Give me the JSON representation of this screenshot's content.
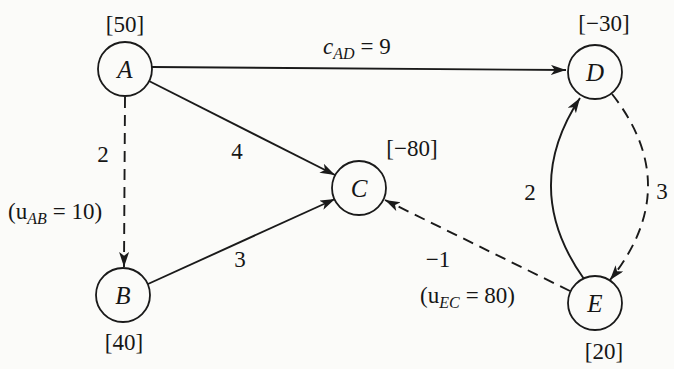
{
  "figure": {
    "colors": {
      "ink": "#1a1a1a",
      "paper": "#fbfbf9"
    }
  },
  "graph": {
    "nodes": {
      "A": {
        "label": "A",
        "supply": "[50]"
      },
      "B": {
        "label": "B",
        "supply": "[40]"
      },
      "C": {
        "label": "C",
        "supply": "[−80]"
      },
      "D": {
        "label": "D",
        "supply": "[−30]"
      },
      "E": {
        "label": "E",
        "supply": "[20]"
      }
    },
    "edges": {
      "AD": {
        "from": "A",
        "to": "D",
        "line": "solid",
        "cost_label": {
          "var": "c",
          "sub": "AD",
          "eq": "= 9"
        }
      },
      "AC": {
        "from": "A",
        "to": "C",
        "line": "solid",
        "cost": "4"
      },
      "AB": {
        "from": "A",
        "to": "B",
        "line": "dashed",
        "cost": "2",
        "capacity_label": {
          "open": "(u",
          "sub": "AB",
          "eq": "= 10)"
        }
      },
      "BC": {
        "from": "B",
        "to": "C",
        "line": "solid",
        "cost": "3"
      },
      "EC": {
        "from": "E",
        "to": "C",
        "line": "dashed",
        "cost": "−1",
        "capacity_label": {
          "open": "(u",
          "sub": "EC",
          "eq": "= 80)"
        }
      },
      "ED": {
        "from": "E",
        "to": "D",
        "line": "solid",
        "cost": "2"
      },
      "DE": {
        "from": "D",
        "to": "E",
        "line": "dashed",
        "cost": "3"
      }
    }
  }
}
